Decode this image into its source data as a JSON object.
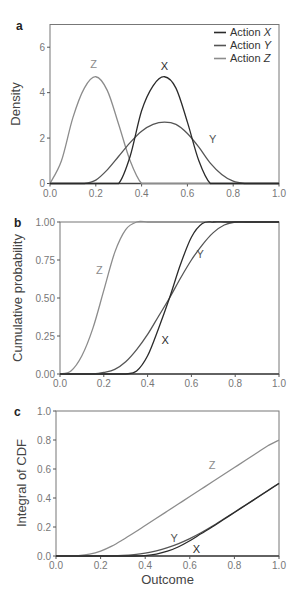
{
  "colors": {
    "X": "#2b2b2b",
    "Y": "#555555",
    "Z": "#8c8c8c",
    "axis": "#444444"
  },
  "chart_data": [
    {
      "panel": "a",
      "type": "line",
      "title": "",
      "xlabel": "",
      "ylabel": "Density",
      "xlim": [
        0,
        1.0
      ],
      "ylim": [
        0,
        7
      ],
      "xticks": [
        "0.0",
        "0.2",
        "0.4",
        "0.6",
        "0.8",
        "1.0"
      ],
      "yticks": [
        "0",
        "2",
        "4",
        "6"
      ],
      "grid": false,
      "legend": {
        "position": "upper right",
        "entries": [
          "Action X",
          "Action Y",
          "Action Z"
        ]
      },
      "annotations": [
        "Z",
        "X",
        "Y"
      ],
      "x": [
        0.0,
        0.05,
        0.1,
        0.15,
        0.2,
        0.25,
        0.3,
        0.35,
        0.4,
        0.45,
        0.5,
        0.55,
        0.6,
        0.65,
        0.7,
        0.75,
        0.8,
        0.85,
        0.9,
        0.95,
        1.0
      ],
      "series": [
        {
          "name": "Action X",
          "values": [
            0,
            0,
            0,
            0,
            0,
            0,
            0,
            1.2,
            3.2,
            4.3,
            4.7,
            4.2,
            2.7,
            1.0,
            0,
            0,
            0,
            0,
            0,
            0,
            0
          ]
        },
        {
          "name": "Action Y",
          "values": [
            0,
            0,
            0,
            0,
            0.15,
            0.6,
            1.2,
            1.8,
            2.3,
            2.6,
            2.7,
            2.6,
            2.2,
            1.6,
            0.9,
            0.4,
            0.1,
            0,
            0,
            0,
            0
          ]
        },
        {
          "name": "Action Z",
          "values": [
            0,
            1.0,
            2.9,
            4.2,
            4.7,
            4.1,
            2.6,
            1.0,
            0,
            0,
            0,
            0,
            0,
            0,
            0,
            0,
            0,
            0,
            0,
            0,
            0
          ]
        }
      ]
    },
    {
      "panel": "b",
      "type": "line",
      "title": "",
      "xlabel": "",
      "ylabel": "Cumulative probability",
      "xlim": [
        0,
        1.0
      ],
      "ylim": [
        0,
        1.0
      ],
      "xticks": [
        "0.0",
        "0.2",
        "0.4",
        "0.6",
        "0.8",
        "1.0"
      ],
      "yticks": [
        "0.00",
        "0.25",
        "0.50",
        "0.75",
        "1.00"
      ],
      "grid": false,
      "annotations": [
        "Z",
        "Y",
        "X"
      ],
      "x": [
        0.0,
        0.05,
        0.1,
        0.15,
        0.2,
        0.25,
        0.3,
        0.35,
        0.4,
        0.45,
        0.5,
        0.55,
        0.6,
        0.65,
        0.7,
        0.75,
        0.8,
        0.85,
        0.9,
        0.95,
        1.0
      ],
      "series": [
        {
          "name": "Action X",
          "values": [
            0,
            0,
            0,
            0,
            0,
            0,
            0,
            0.02,
            0.12,
            0.3,
            0.5,
            0.72,
            0.9,
            0.99,
            1.0,
            1.0,
            1.0,
            1.0,
            1.0,
            1.0,
            1.0
          ]
        },
        {
          "name": "Action Y",
          "values": [
            0,
            0,
            0,
            0,
            0.01,
            0.03,
            0.08,
            0.16,
            0.26,
            0.38,
            0.5,
            0.63,
            0.75,
            0.85,
            0.93,
            0.98,
            1.0,
            1.0,
            1.0,
            1.0,
            1.0
          ]
        },
        {
          "name": "Action Z",
          "values": [
            0,
            0.02,
            0.12,
            0.3,
            0.55,
            0.8,
            0.95,
            1.0,
            1.0,
            1.0,
            1.0,
            1.0,
            1.0,
            1.0,
            1.0,
            1.0,
            1.0,
            1.0,
            1.0,
            1.0,
            1.0
          ]
        }
      ]
    },
    {
      "panel": "c",
      "type": "line",
      "title": "",
      "xlabel": "Outcome",
      "ylabel": "Integral of CDF",
      "xlim": [
        0,
        1.0
      ],
      "ylim": [
        0,
        1.0
      ],
      "xticks": [
        "0.0",
        "0.2",
        "0.4",
        "0.6",
        "0.8",
        "1.0"
      ],
      "yticks": [
        "0.0",
        "0.2",
        "0.4",
        "0.6",
        "0.8",
        "1.0"
      ],
      "grid": false,
      "annotations": [
        "Z",
        "Y",
        "X"
      ],
      "x": [
        0.0,
        0.05,
        0.1,
        0.15,
        0.2,
        0.25,
        0.3,
        0.35,
        0.4,
        0.45,
        0.5,
        0.55,
        0.6,
        0.65,
        0.7,
        0.75,
        0.8,
        0.85,
        0.9,
        0.95,
        1.0
      ],
      "series": [
        {
          "name": "Action X",
          "values": [
            0,
            0,
            0,
            0,
            0,
            0,
            0,
            0,
            0.003,
            0.013,
            0.033,
            0.064,
            0.105,
            0.153,
            0.2,
            0.25,
            0.3,
            0.35,
            0.4,
            0.45,
            0.5
          ]
        },
        {
          "name": "Action Y",
          "values": [
            0,
            0,
            0,
            0,
            0,
            0.001,
            0.004,
            0.01,
            0.02,
            0.036,
            0.058,
            0.086,
            0.12,
            0.16,
            0.205,
            0.253,
            0.302,
            0.352,
            0.402,
            0.452,
            0.502
          ]
        },
        {
          "name": "Action Z",
          "values": [
            0,
            0,
            0.003,
            0.013,
            0.034,
            0.068,
            0.112,
            0.16,
            0.21,
            0.26,
            0.31,
            0.36,
            0.41,
            0.46,
            0.51,
            0.56,
            0.61,
            0.66,
            0.71,
            0.76,
            0.8
          ]
        }
      ]
    }
  ],
  "panels": {
    "a": {
      "label": "a",
      "ylabel": "Density"
    },
    "b": {
      "label": "b",
      "ylabel": "Cumulative probability"
    },
    "c": {
      "label": "c",
      "ylabel": "Integral of CDF",
      "xlabel": "Outcome"
    }
  },
  "legend": [
    {
      "text": "Action ",
      "italic": "X"
    },
    {
      "text": "Action ",
      "italic": "Y"
    },
    {
      "text": "Action ",
      "italic": "Z"
    }
  ]
}
